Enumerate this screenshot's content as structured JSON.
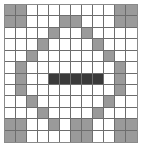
{
  "figure": {
    "name": "cell-grid-diamond-pattern",
    "type": "grid",
    "rows": 12,
    "cols": 12,
    "colors": {
      "empty": "#ffffff",
      "gray": "#9a9a9a",
      "dark": "#3a3a3a",
      "gridline": "#6d6d6d",
      "border": "#8a8a8a",
      "background": "#ffffff"
    },
    "legend": {
      "empty_label": "empty",
      "gray_label": "gray",
      "dark_label": "dark"
    },
    "grid": [
      [
        "gray",
        "gray",
        "empty",
        "empty",
        "empty",
        "empty",
        "empty",
        "empty",
        "empty",
        "empty",
        "gray",
        "gray"
      ],
      [
        "gray",
        "gray",
        "empty",
        "empty",
        "empty",
        "gray",
        "gray",
        "empty",
        "empty",
        "empty",
        "gray",
        "gray"
      ],
      [
        "empty",
        "empty",
        "empty",
        "empty",
        "gray",
        "empty",
        "empty",
        "gray",
        "empty",
        "empty",
        "empty",
        "empty"
      ],
      [
        "empty",
        "empty",
        "empty",
        "gray",
        "empty",
        "empty",
        "empty",
        "empty",
        "gray",
        "empty",
        "empty",
        "empty"
      ],
      [
        "empty",
        "empty",
        "gray",
        "empty",
        "empty",
        "empty",
        "empty",
        "empty",
        "empty",
        "gray",
        "empty",
        "empty"
      ],
      [
        "empty",
        "gray",
        "empty",
        "empty",
        "empty",
        "empty",
        "empty",
        "empty",
        "empty",
        "empty",
        "gray",
        "empty"
      ],
      [
        "empty",
        "gray",
        "empty",
        "empty",
        "dark",
        "dark",
        "dark",
        "dark",
        "dark",
        "empty",
        "gray",
        "empty"
      ],
      [
        "empty",
        "gray",
        "empty",
        "empty",
        "empty",
        "empty",
        "empty",
        "empty",
        "empty",
        "empty",
        "gray",
        "empty"
      ],
      [
        "empty",
        "empty",
        "gray",
        "empty",
        "empty",
        "empty",
        "empty",
        "empty",
        "empty",
        "gray",
        "empty",
        "empty"
      ],
      [
        "empty",
        "empty",
        "empty",
        "gray",
        "empty",
        "empty",
        "empty",
        "empty",
        "gray",
        "empty",
        "empty",
        "empty"
      ],
      [
        "gray",
        "gray",
        "empty",
        "empty",
        "gray",
        "empty",
        "gray",
        "gray",
        "empty",
        "empty",
        "gray",
        "gray"
      ],
      [
        "gray",
        "gray",
        "empty",
        "empty",
        "empty",
        "empty",
        "gray",
        "gray",
        "empty",
        "empty",
        "gray",
        "gray"
      ]
    ]
  }
}
